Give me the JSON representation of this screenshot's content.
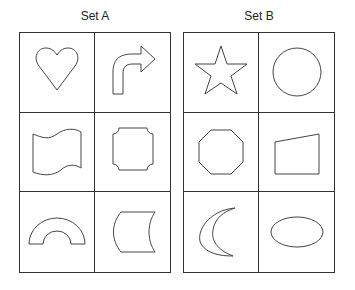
{
  "sets": [
    {
      "title": "Set A",
      "shapes": [
        {
          "name": "heart",
          "icon": "heart-icon"
        },
        {
          "name": "curved arrow turning right",
          "icon": "curved-arrow-right-icon"
        },
        {
          "name": "wavy flag",
          "icon": "wavy-flag-icon"
        },
        {
          "name": "rectangle with notched corners",
          "icon": "notched-rectangle-icon"
        },
        {
          "name": "half ring arch",
          "icon": "arch-icon"
        },
        {
          "name": "concave-sided rectangle",
          "icon": "concave-rectangle-icon"
        }
      ]
    },
    {
      "title": "Set B",
      "shapes": [
        {
          "name": "five-pointed star",
          "icon": "star-icon"
        },
        {
          "name": "circle",
          "icon": "circle-icon"
        },
        {
          "name": "octagon",
          "icon": "octagon-icon"
        },
        {
          "name": "trapezoid",
          "icon": "trapezoid-icon"
        },
        {
          "name": "crescent moon",
          "icon": "crescent-icon"
        },
        {
          "name": "ellipse",
          "icon": "ellipse-icon"
        }
      ]
    }
  ]
}
